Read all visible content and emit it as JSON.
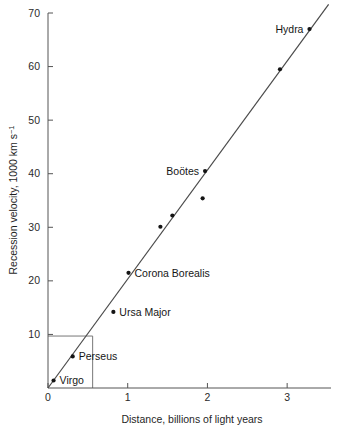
{
  "chart_data": {
    "type": "scatter",
    "title": "",
    "xlabel": "Distance, billions of light years",
    "ylabel": "Recession velocity, 1000 km s",
    "ylabel_exponent": "−1",
    "xlim": [
      0,
      3.55
    ],
    "ylim": [
      0,
      70
    ],
    "xticks": [
      0,
      1,
      2,
      3
    ],
    "xtick_labels": [
      "0",
      "1",
      "2",
      "3"
    ],
    "yticks": [
      10,
      20,
      30,
      40,
      50,
      60,
      70
    ],
    "ytick_labels": [
      "10",
      "20",
      "30",
      "40",
      "50",
      "60",
      "70"
    ],
    "grid": false,
    "legend": "none",
    "points": [
      {
        "label": "Virgo",
        "x": 0.07,
        "y": 1.4,
        "label_pos": "right"
      },
      {
        "label": "Perseus",
        "x": 0.31,
        "y": 5.9,
        "label_pos": "right"
      },
      {
        "label": "Ursa Major",
        "x": 0.82,
        "y": 14.2,
        "label_pos": "right"
      },
      {
        "label": "Corona Borealis",
        "x": 1.01,
        "y": 21.5,
        "label_pos": "right"
      },
      {
        "label": "",
        "x": 1.41,
        "y": 30.1,
        "label_pos": "none"
      },
      {
        "label": "",
        "x": 1.56,
        "y": 32.2,
        "label_pos": "none"
      },
      {
        "label": "",
        "x": 1.94,
        "y": 35.4,
        "label_pos": "none"
      },
      {
        "label": "Boötes",
        "x": 1.97,
        "y": 40.5,
        "label_pos": "left"
      },
      {
        "label": "",
        "x": 2.91,
        "y": 59.5,
        "label_pos": "none"
      },
      {
        "label": "Hydra",
        "x": 3.28,
        "y": 67.0,
        "label_pos": "left"
      }
    ],
    "fit_line": {
      "x_start": 0.0,
      "y_start": 0.0,
      "x_end": 3.52,
      "y_end": 71.6
    },
    "guide_lines": {
      "horizontal_value": 9.7,
      "vertical_value": 0.56,
      "description": "Reference construction lines from the velocity axis at 10 down to the distance axis"
    },
    "colors": {
      "background": "#ffffff",
      "axis": "#555555",
      "fit_line": "#4a4a4a",
      "point": "#141414",
      "guide": "#777777",
      "text": "#1a1a1a"
    }
  }
}
